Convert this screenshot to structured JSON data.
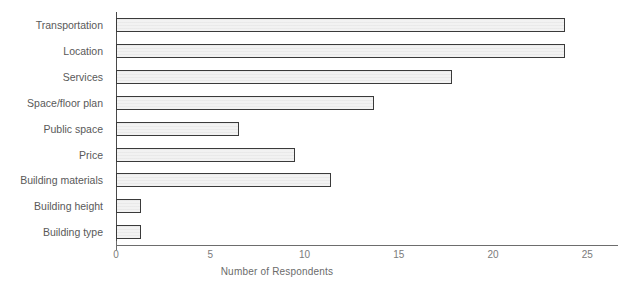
{
  "chart_data": {
    "type": "bar",
    "orientation": "horizontal",
    "title": "",
    "xlabel": "Number of Respondents",
    "ylabel": "",
    "xlim": [
      0,
      25
    ],
    "xticks": [
      0,
      5,
      10,
      15,
      20,
      25
    ],
    "grid": false,
    "legend": null,
    "categories": [
      "Transportation",
      "Location",
      "Services",
      "Space/floor plan",
      "Public space",
      "Price",
      "Building materials",
      "Building height",
      "Building type"
    ],
    "values": [
      23.8,
      23.8,
      17.8,
      13.7,
      6.5,
      9.5,
      11.4,
      1.3,
      1.3
    ],
    "bar_color": "#f2f2f2",
    "bar_edge_color": "#3a3a3a",
    "axis_color": "#6d6d6d",
    "text_color": "#5f5f5f"
  },
  "axis": {
    "tick_labels": [
      "0",
      "5",
      "10",
      "15",
      "20",
      "25"
    ],
    "title": "Number of Respondents"
  },
  "categories": [
    {
      "label": "Transportation"
    },
    {
      "label": "Location"
    },
    {
      "label": "Services"
    },
    {
      "label": "Space/floor plan"
    },
    {
      "label": "Public space"
    },
    {
      "label": "Price"
    },
    {
      "label": "Building materials"
    },
    {
      "label": "Building height"
    },
    {
      "label": "Building type"
    }
  ]
}
